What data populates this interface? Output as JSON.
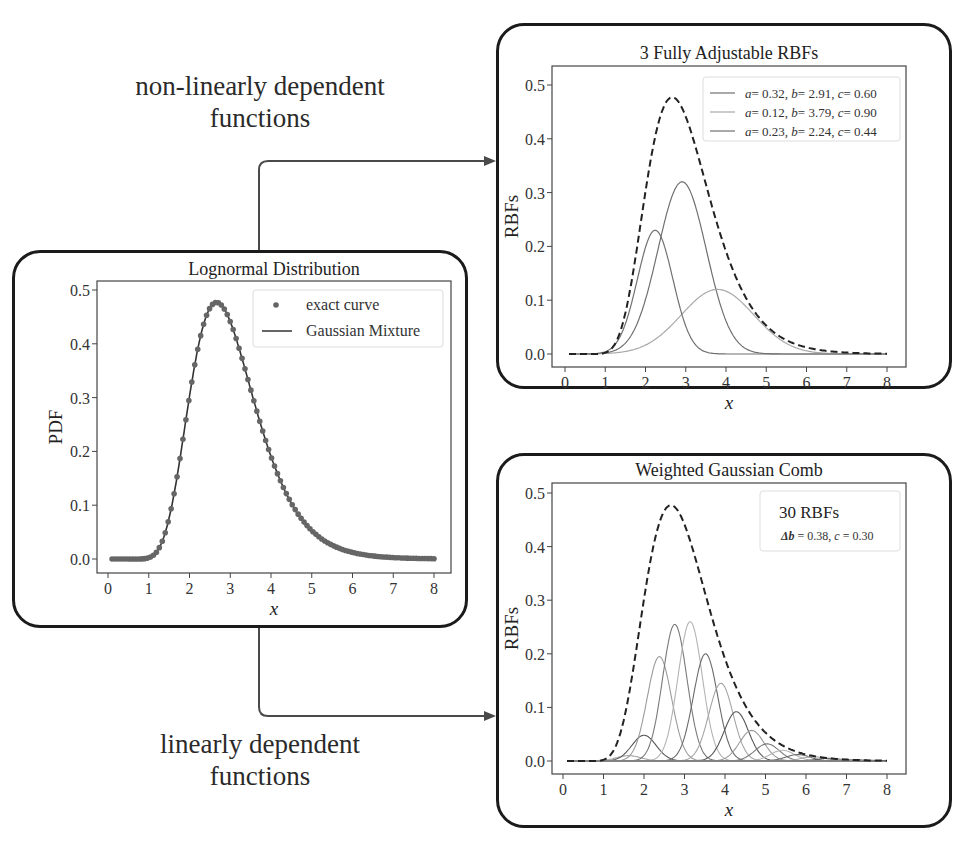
{
  "captions": {
    "top": [
      "non-linearly dependent",
      "functions"
    ],
    "bottom": [
      "linearly dependent",
      "functions"
    ]
  },
  "colors": {
    "frame": "#1b1b1b",
    "axes": "#444444",
    "curve_dark": "#333333",
    "marker": "#666666",
    "gaussian_mid": "#707070",
    "gaussian_light": "#a8a8a8",
    "arrow": "#4a4a4a"
  },
  "chart_data": [
    {
      "id": "lognormal",
      "type": "line",
      "title": "Lognormal Distribution",
      "xlabel": "x",
      "ylabel": "PDF",
      "xlim": [
        -0.1,
        8.3
      ],
      "ylim": [
        -0.025,
        0.515
      ],
      "xticks": [
        "0",
        "1",
        "2",
        "3",
        "4",
        "5",
        "6",
        "7",
        "8"
      ],
      "yticks": [
        "0.0",
        "0.1",
        "0.2",
        "0.3",
        "0.4",
        "0.5"
      ],
      "grid": false,
      "legend_position": "upper right",
      "legend": [
        {
          "label": "exact curve",
          "style": "marker"
        },
        {
          "label": "Gaussian Mixture",
          "style": "solid"
        }
      ],
      "series": [
        {
          "name": "exact curve",
          "kind": "scatter",
          "distribution": "lognormal",
          "mu": 1.07,
          "sigma": 0.3,
          "x_start": 0.1,
          "x_end": 8.0,
          "n_points": 110
        },
        {
          "name": "Gaussian Mixture",
          "kind": "line",
          "distribution": "lognormal",
          "mu": 1.07,
          "sigma": 0.3
        }
      ],
      "peak": {
        "x": 2.65,
        "y": 0.49
      }
    },
    {
      "id": "three-rbfs",
      "type": "line",
      "title": "3 Fully Adjustable RBFs",
      "xlabel": "x",
      "ylabel": "RBFs",
      "xlim": [
        -0.1,
        8.3
      ],
      "ylim": [
        -0.025,
        0.515
      ],
      "xticks": [
        "0",
        "1",
        "2",
        "3",
        "4",
        "5",
        "6",
        "7",
        "8"
      ],
      "yticks": [
        "0.0",
        "0.1",
        "0.2",
        "0.3",
        "0.4",
        "0.5"
      ],
      "grid": false,
      "legend_position": "upper right",
      "legend": [
        {
          "label_a": "a",
          "a": "0.32",
          "label_b": "b",
          "b": "2.91",
          "label_c": "c",
          "c": "0.60"
        },
        {
          "label_a": "a",
          "a": "0.12",
          "label_b": "b",
          "b": "3.79",
          "label_c": "c",
          "c": "0.90"
        },
        {
          "label_a": "a",
          "a": "0.23",
          "label_b": "b",
          "b": "2.24",
          "label_c": "c",
          "c": "0.44"
        }
      ],
      "series": [
        {
          "name": "a=0.32, b=2.91, c=0.60",
          "a": 0.32,
          "b": 2.91,
          "c": 0.6,
          "shade": "mid"
        },
        {
          "name": "a=0.12, b=3.79, c=0.90",
          "a": 0.12,
          "b": 3.79,
          "c": 0.9,
          "shade": "light"
        },
        {
          "name": "a=0.23, b=2.24, c=0.44",
          "a": 0.23,
          "b": 2.24,
          "c": 0.44,
          "shade": "mid"
        },
        {
          "name": "target",
          "kind": "dashed",
          "distribution": "lognormal",
          "mu": 1.07,
          "sigma": 0.3
        }
      ]
    },
    {
      "id": "gaussian-comb",
      "type": "line",
      "title": "Weighted Gaussian Comb",
      "xlabel": "x",
      "ylabel": "RBFs",
      "xlim": [
        -0.1,
        8.3
      ],
      "ylim": [
        -0.025,
        0.515
      ],
      "xticks": [
        "0",
        "1",
        "2",
        "3",
        "4",
        "5",
        "6",
        "7",
        "8"
      ],
      "yticks": [
        "0.0",
        "0.1",
        "0.2",
        "0.3",
        "0.4",
        "0.5"
      ],
      "grid": false,
      "legend_position": "upper right",
      "annotation": {
        "line1": "30 RBFs",
        "line2_symbol": "Δb",
        "line2_rest": " = 0.38, ",
        "line2_c": "c",
        "line2_val": " = 0.30"
      },
      "n_rbfs": 30,
      "delta_b": 0.38,
      "c": 0.3,
      "series": [
        {
          "name": "comb",
          "centers_start": 0.1,
          "spacing": 0.38,
          "count": 30,
          "width": 0.3,
          "weights": [
            0,
            0,
            0,
            0.001,
            0.01,
            0.048,
            0.195,
            0.255,
            0.26,
            0.2,
            0.145,
            0.092,
            0.057,
            0.032,
            0.02,
            0.012,
            0.008,
            0.005,
            0.003,
            0.002,
            0.001,
            0.001,
            0,
            0,
            0,
            0,
            0,
            0,
            0,
            0
          ]
        },
        {
          "name": "target",
          "kind": "dashed",
          "distribution": "lognormal",
          "mu": 1.07,
          "sigma": 0.3
        }
      ]
    }
  ]
}
